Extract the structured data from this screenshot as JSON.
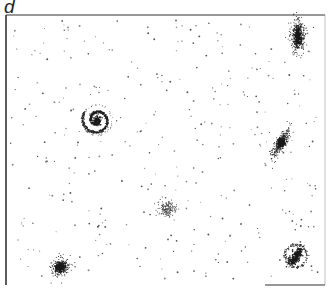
{
  "figure": {
    "panel_label": "d",
    "frame": {
      "x": 6,
      "y": 15,
      "width": 319,
      "height": 270,
      "stroke": "#333333"
    },
    "colors": {
      "ink": "#1a1a1a",
      "background": "#ffffff"
    }
  },
  "objects": [
    {
      "type": "spiral-galaxy-face-on",
      "cx": 97,
      "cy": 120,
      "r": 15
    },
    {
      "type": "elliptical-galaxy-elongated",
      "cx": 298,
      "cy": 36,
      "rx": 6,
      "ry": 15,
      "angle": 0
    },
    {
      "type": "edge-on-galaxy",
      "cx": 281,
      "cy": 143,
      "rx": 14,
      "ry": 5,
      "angle": -60
    },
    {
      "type": "diffuse-cluster",
      "cx": 167,
      "cy": 209,
      "r": 10
    },
    {
      "type": "elliptical-galaxy-round",
      "cx": 60,
      "cy": 267,
      "r": 10
    },
    {
      "type": "barred-spiral-galaxy",
      "cx": 296,
      "cy": 256,
      "rx": 13,
      "ry": 15
    }
  ]
}
